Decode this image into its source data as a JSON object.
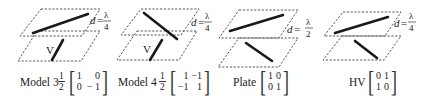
{
  "panels": [
    {
      "name": "Model 3",
      "spacing": {
        "prefix": "d",
        "eq": "=",
        "num": "λ",
        "den": "4"
      },
      "lower_label": "V",
      "matrix": {
        "scalar_num": "1",
        "scalar_den": "2",
        "cells": [
          "1",
          "0",
          "0",
          "− 1"
        ]
      }
    },
    {
      "name": "Model 4",
      "spacing": {
        "prefix": "d",
        "eq": "=",
        "num": "λ",
        "den": "4"
      },
      "lower_label": "V",
      "matrix": {
        "scalar_num": "1",
        "scalar_den": "2",
        "cells": [
          "1",
          "−1",
          "−1",
          "1"
        ]
      }
    },
    {
      "name": "Plate",
      "spacing": {
        "prefix": "d",
        "eq": "=",
        "num": "λ",
        "den": "2"
      },
      "lower_label": "",
      "matrix": {
        "scalar_num": "",
        "scalar_den": "",
        "cells": [
          "1",
          "0",
          "0",
          "1"
        ]
      }
    },
    {
      "name": "HV",
      "spacing": {
        "prefix": "d",
        "eq": "=",
        "num": "λ",
        "den": "4"
      },
      "lower_label": "",
      "matrix": {
        "scalar_num": "",
        "scalar_den": "",
        "cells": [
          "0",
          "1",
          "1",
          "0"
        ]
      }
    }
  ]
}
